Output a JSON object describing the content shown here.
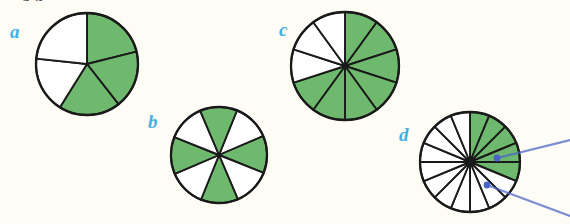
{
  "page": {
    "background_color": "#fdfcf5",
    "cut_off_heading": "a.4",
    "shaded_color": "#6fb96f",
    "unshaded_color": "#ffffff",
    "outline_color": "#1a1a1a",
    "label_color": "#41b0e4",
    "pointer_color": "#4a63c8"
  },
  "figures": [
    {
      "id": "a",
      "label": "a",
      "label_x": 10,
      "label_y": 22,
      "cx": 87,
      "cy": 64,
      "r": 51,
      "total_sectors": 5,
      "shaded_sectors": 3,
      "fraction": "3/5",
      "start_angle_deg": -90,
      "sector_angles_deg": [
        72,
        72,
        72,
        72,
        72
      ],
      "shaded_indices": [
        0,
        1,
        2
      ],
      "equal_sectors": false,
      "custom_boundaries_deg": [
        -90,
        -14,
        52,
        122,
        186,
        270
      ]
    },
    {
      "id": "b",
      "label": "b",
      "label_x": 148,
      "label_y": 112,
      "cx": 219,
      "cy": 155,
      "r": 48,
      "total_sectors": 8,
      "shaded_sectors": 4,
      "fraction": "4/8",
      "start_angle_deg": -68,
      "sector_angles_deg": [
        45,
        45,
        45,
        45,
        45,
        45,
        45,
        45
      ],
      "shaded_indices": [
        1,
        3,
        5,
        7
      ],
      "equal_sectors": true
    },
    {
      "id": "c",
      "label": "c",
      "label_x": 279,
      "label_y": 20,
      "cx": 345,
      "cy": 66,
      "r": 54,
      "total_sectors": 10,
      "shaded_sectors": 7,
      "fraction": "7/10",
      "start_angle_deg": -90,
      "sector_angles_deg": [
        36,
        36,
        36,
        36,
        36,
        36,
        36,
        36,
        36,
        36
      ],
      "shaded_indices": [
        0,
        1,
        2,
        3,
        4,
        5,
        6
      ],
      "equal_sectors": true
    },
    {
      "id": "d",
      "label": "d",
      "label_x": 399,
      "label_y": 125,
      "cx": 470,
      "cy": 162,
      "r": 50,
      "total_sectors": 16,
      "shaded_sectors": 5,
      "fraction": "5/16",
      "start_angle_deg": -90,
      "sector_angles_deg": [
        22.5,
        22.5,
        22.5,
        22.5,
        22.5,
        22.5,
        22.5,
        22.5,
        22.5,
        22.5,
        22.5,
        22.5,
        22.5,
        22.5,
        22.5,
        22.5
      ],
      "shaded_indices": [
        0,
        1,
        2,
        3,
        4
      ],
      "equal_sectors": true
    }
  ],
  "pointers": [
    {
      "name": "pointer-upper",
      "x1": 570,
      "y1": 140,
      "x2": 497,
      "y2": 158,
      "dot_x": 497,
      "dot_y": 158
    },
    {
      "name": "pointer-lower",
      "x1": 570,
      "y1": 216,
      "x2": 487,
      "y2": 185,
      "dot_x": 487,
      "dot_y": 185
    }
  ]
}
